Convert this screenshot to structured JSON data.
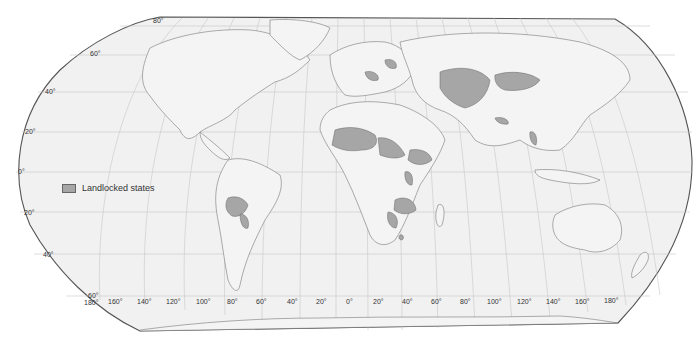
{
  "map": {
    "projection": "Robinson",
    "legend": {
      "label": "Landlocked states",
      "swatch_color": "#a6a6a6"
    },
    "colors": {
      "ocean": "#f0f0f0",
      "land": "#efefef",
      "landlocked": "#a6a6a6",
      "border": "#777777",
      "graticule": "#c8c8c8",
      "frame": "#555555"
    },
    "latitude_labels": {
      "north": [
        "80°",
        "60°",
        "40°",
        "20°"
      ],
      "equator": "0°",
      "south": [
        "20°",
        "40°",
        "60°"
      ]
    },
    "longitude_labels": [
      "180°",
      "160°",
      "140°",
      "120°",
      "100°",
      "80°",
      "60°",
      "40°",
      "20°",
      "0°",
      "20°",
      "40°",
      "60°",
      "80°",
      "100°",
      "120°",
      "140°",
      "160°",
      "180°"
    ],
    "landlocked_regions": [
      "Bolivia",
      "Paraguay",
      "Mali",
      "Niger",
      "Chad",
      "Burkina Faso",
      "Central African Republic",
      "South Sudan",
      "Ethiopia",
      "Uganda",
      "Rwanda",
      "Burundi",
      "Zambia",
      "Malawi",
      "Zimbabwe",
      "Botswana",
      "Lesotho",
      "Eswatini",
      "Belarus",
      "Hungary",
      "Austria",
      "Czechia",
      "Slovakia",
      "Serbia",
      "Switzerland",
      "Kazakhstan",
      "Uzbekistan",
      "Turkmenistan",
      "Kyrgyzstan",
      "Tajikistan",
      "Afghanistan",
      "Mongolia",
      "Nepal",
      "Bhutan",
      "Laos"
    ]
  }
}
